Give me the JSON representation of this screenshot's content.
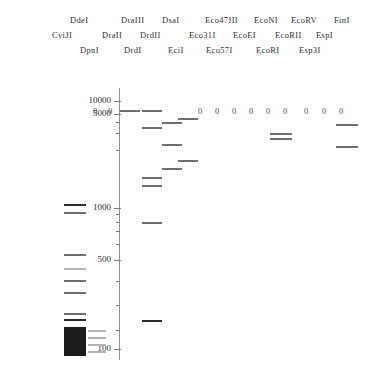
{
  "figure": {
    "name": "restriction-digest-virtual-gel",
    "background_color": "#ffffff",
    "ink_color": "#2e2e2e"
  },
  "header": {
    "rows": [
      {
        "row_index": 0,
        "labels": [
          {
            "text": "DdeI",
            "x": 70,
            "y": 16
          },
          {
            "text": "DraIII",
            "x": 121,
            "y": 16
          },
          {
            "text": "DsaI",
            "x": 162,
            "y": 16
          },
          {
            "text": "Eco47III",
            "x": 205,
            "y": 16
          },
          {
            "text": "EcoNI",
            "x": 254,
            "y": 16
          },
          {
            "text": "EcoRV",
            "x": 291,
            "y": 16
          },
          {
            "text": "FinI",
            "x": 334,
            "y": 16
          }
        ]
      },
      {
        "row_index": 1,
        "labels": [
          {
            "text": "CviJI",
            "x": 52,
            "y": 31
          },
          {
            "text": "DraII",
            "x": 102,
            "y": 31
          },
          {
            "text": "DrdII",
            "x": 140,
            "y": 31
          },
          {
            "text": "Eco31I",
            "x": 189,
            "y": 31
          },
          {
            "text": "EcoEI",
            "x": 233,
            "y": 31
          },
          {
            "text": "EcoRII",
            "x": 275,
            "y": 31
          },
          {
            "text": "EspI",
            "x": 316,
            "y": 31
          }
        ]
      },
      {
        "row_index": 2,
        "labels": [
          {
            "text": "DpnI",
            "x": 80,
            "y": 46
          },
          {
            "text": "DrdI",
            "x": 124,
            "y": 46
          },
          {
            "text": "EciI",
            "x": 168,
            "y": 46
          },
          {
            "text": "Eco57I",
            "x": 206,
            "y": 46
          },
          {
            "text": "EcoRI",
            "x": 256,
            "y": 46
          },
          {
            "text": "Esp3I",
            "x": 299,
            "y": 46
          }
        ]
      }
    ]
  },
  "chart_data": {
    "type": "gel",
    "title": "",
    "xlabel": "",
    "ylabel": "Fragment size (bp)",
    "yscale": "log",
    "ylim": [
      100,
      12000
    ],
    "grid": false,
    "legend": "none",
    "axis": {
      "x_px": 119,
      "top_px": 88,
      "bottom_px": 360,
      "tick_labels": [
        "10000",
        "5000",
        "1000",
        "500",
        "100"
      ],
      "ticks": [
        {
          "label": "10000",
          "value": 10000,
          "y": 101,
          "major": true
        },
        {
          "label": "5000",
          "value": 5000,
          "y": 114,
          "major": true
        },
        {
          "label": "",
          "value": 4000,
          "y": 122,
          "major": false
        },
        {
          "label": "",
          "value": 3000,
          "y": 133,
          "major": false
        },
        {
          "label": "",
          "value": 2000,
          "y": 150,
          "major": false
        },
        {
          "label": "1000",
          "value": 1000,
          "y": 208,
          "major": true
        },
        {
          "label": "",
          "value": 900,
          "y": 214,
          "major": false
        },
        {
          "label": "",
          "value": 800,
          "y": 222,
          "major": false
        },
        {
          "label": "",
          "value": 700,
          "y": 231,
          "major": false
        },
        {
          "label": "",
          "value": 600,
          "y": 244,
          "major": false
        },
        {
          "label": "500",
          "value": 500,
          "y": 260,
          "major": true
        },
        {
          "label": "",
          "value": 400,
          "y": 281,
          "major": false
        },
        {
          "label": "",
          "value": 300,
          "y": 305,
          "major": false
        },
        {
          "label": "",
          "value": 200,
          "y": 330,
          "major": false
        },
        {
          "label": "100",
          "value": 100,
          "y": 349,
          "major": true
        }
      ]
    },
    "lanes": [
      {
        "lane_index": 0,
        "name": "ladder-lane-left",
        "x": 64,
        "width": 22,
        "zero_marker": null,
        "bands": [
          {
            "y": 204,
            "intensity": "dark"
          },
          {
            "y": 212,
            "intensity": "medium"
          },
          {
            "y": 254,
            "intensity": "medium"
          },
          {
            "y": 268,
            "intensity": "light"
          },
          {
            "y": 280,
            "intensity": "medium"
          },
          {
            "y": 292,
            "intensity": "medium"
          },
          {
            "y": 313,
            "intensity": "medium"
          },
          {
            "y": 319,
            "intensity": "dark"
          }
        ],
        "smear": {
          "y_top": 327,
          "y_bottom": 356,
          "color": "#1d1d1d"
        }
      },
      {
        "lane_index": 1,
        "name": "lane-ddei-cviji",
        "x": 88,
        "width": 18,
        "zero_marker": {
          "text": "0",
          "x": 93,
          "y": 107
        },
        "bands": [
          {
            "y": 330,
            "intensity": "light"
          },
          {
            "y": 337,
            "intensity": "light"
          },
          {
            "y": 344,
            "intensity": "light"
          },
          {
            "y": 351,
            "intensity": "light"
          }
        ],
        "smear": null
      },
      {
        "lane_index": 2,
        "name": "lane-dpni",
        "x": 106,
        "width": 18,
        "zero_marker": {
          "text": "0",
          "x": 108,
          "y": 107
        },
        "bands": [],
        "smear": null
      },
      {
        "lane_index": 3,
        "name": "lane-draiii",
        "x": 120,
        "width": 20,
        "zero_marker": null,
        "bands": [
          {
            "y": 110,
            "intensity": "medium"
          }
        ],
        "smear": null
      },
      {
        "lane_index": 4,
        "name": "lane-draii",
        "x": 142,
        "width": 20,
        "zero_marker": null,
        "bands": [
          {
            "y": 110,
            "intensity": "medium"
          },
          {
            "y": 222,
            "intensity": "medium"
          },
          {
            "y": 320,
            "intensity": "dark"
          }
        ],
        "smear": null
      },
      {
        "lane_index": 5,
        "name": "lane-drdi",
        "x": 142,
        "width": 20,
        "zero_marker": null,
        "bands": [
          {
            "y": 127,
            "intensity": "medium"
          },
          {
            "y": 177,
            "intensity": "medium"
          },
          {
            "y": 185,
            "intensity": "medium"
          }
        ],
        "smear": null
      },
      {
        "lane_index": 6,
        "name": "lane-drdii",
        "x": 162,
        "width": 20,
        "zero_marker": null,
        "bands": [
          {
            "y": 122,
            "intensity": "medium"
          },
          {
            "y": 144,
            "intensity": "medium"
          },
          {
            "y": 168,
            "intensity": "medium"
          }
        ],
        "smear": null
      },
      {
        "lane_index": 7,
        "name": "lane-dsai",
        "x": 178,
        "width": 20,
        "zero_marker": null,
        "bands": [
          {
            "y": 118,
            "intensity": "medium"
          },
          {
            "y": 160,
            "intensity": "medium"
          }
        ],
        "smear": null
      },
      {
        "lane_index": 8,
        "name": "lane-ecii",
        "x": 196,
        "width": 16,
        "zero_marker": {
          "text": "0",
          "x": 198,
          "y": 107
        },
        "bands": [],
        "smear": null
      },
      {
        "lane_index": 9,
        "name": "lane-eco31i",
        "x": 213,
        "width": 16,
        "zero_marker": {
          "text": "0",
          "x": 215,
          "y": 107
        },
        "bands": [],
        "smear": null
      },
      {
        "lane_index": 10,
        "name": "lane-eco47iii",
        "x": 230,
        "width": 16,
        "zero_marker": {
          "text": "0",
          "x": 232,
          "y": 107
        },
        "bands": [],
        "smear": null
      },
      {
        "lane_index": 11,
        "name": "lane-eco57i",
        "x": 247,
        "width": 16,
        "zero_marker": {
          "text": "0",
          "x": 249,
          "y": 107
        },
        "bands": [],
        "smear": null
      },
      {
        "lane_index": 12,
        "name": "lane-ecoei",
        "x": 264,
        "width": 16,
        "zero_marker": {
          "text": "0",
          "x": 266,
          "y": 107
        },
        "bands": [],
        "smear": null
      },
      {
        "lane_index": 13,
        "name": "lane-econi",
        "x": 270,
        "width": 22,
        "zero_marker": {
          "text": "0",
          "x": 283,
          "y": 107
        },
        "bands": [
          {
            "y": 133,
            "intensity": "medium"
          },
          {
            "y": 138,
            "intensity": "medium"
          }
        ],
        "smear": null
      },
      {
        "lane_index": 14,
        "name": "lane-ecori",
        "x": 302,
        "width": 16,
        "zero_marker": {
          "text": "0",
          "x": 304,
          "y": 107
        },
        "bands": [],
        "smear": null
      },
      {
        "lane_index": 15,
        "name": "lane-ecorii",
        "x": 320,
        "width": 16,
        "zero_marker": {
          "text": "0",
          "x": 322,
          "y": 107
        },
        "bands": [],
        "smear": null
      },
      {
        "lane_index": 16,
        "name": "lane-ecorv",
        "x": 337,
        "width": 16,
        "zero_marker": {
          "text": "0",
          "x": 339,
          "y": 107
        },
        "bands": [],
        "smear": null
      },
      {
        "lane_index": 17,
        "name": "lane-espi-fini",
        "x": 336,
        "width": 22,
        "zero_marker": null,
        "bands": [
          {
            "y": 124,
            "intensity": "medium"
          },
          {
            "y": 146,
            "intensity": "medium"
          }
        ],
        "smear": null
      }
    ]
  }
}
